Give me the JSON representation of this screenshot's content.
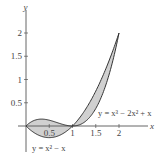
{
  "chart_data": {
    "type": "area",
    "title": "",
    "xlabel": "x",
    "ylabel": "y",
    "xlim": [
      0,
      2.2
    ],
    "ylim": [
      -0.3,
      2.2
    ],
    "x_ticks": [
      0.5,
      1,
      1.5,
      2
    ],
    "x_tick_labels": [
      "0.5",
      "1",
      "1.5",
      "2"
    ],
    "y_ticks": [
      0.5,
      1,
      1.5,
      2
    ],
    "y_tick_labels": [
      "0.5",
      "1",
      "1.5",
      "2"
    ],
    "grid": false,
    "series": [
      {
        "name": "y = x^3 - 2x^2 + x",
        "label": "y = x³ − 2x² + x",
        "x": [
          0,
          0.25,
          0.5,
          0.75,
          1,
          1.25,
          1.5,
          1.75,
          2
        ],
        "values": [
          0,
          0.1406,
          0.125,
          0.0469,
          0,
          0.0781,
          0.375,
          0.9844,
          2
        ]
      },
      {
        "name": "y = x^2 - x",
        "label": "y = x² − x",
        "x": [
          0,
          0.25,
          0.5,
          0.75,
          1,
          1.25,
          1.5,
          1.75,
          2
        ],
        "values": [
          0,
          -0.1875,
          -0.25,
          -0.1875,
          0,
          0.3125,
          0.75,
          1.3125,
          2
        ]
      }
    ],
    "shaded_regions": [
      {
        "between": [
          "y = x^3 - 2x^2 + x",
          "y = x^2 - x"
        ],
        "x_range": [
          0,
          1
        ],
        "color": "#d0d0d0"
      },
      {
        "between": [
          "y = x^3 - 2x^2 + x",
          "y = x^2 - x"
        ],
        "x_range": [
          1,
          2
        ],
        "color": "#d0d0d0"
      }
    ],
    "intersections": [
      [
        0,
        0
      ],
      [
        1,
        0
      ],
      [
        2,
        2
      ]
    ]
  },
  "labels": {
    "x_axis": "x",
    "y_axis": "y",
    "curve_cubic": "y = x³ − 2x² + x",
    "curve_quadratic": "y = x² − x",
    "x_ticks": [
      "0.5",
      "1",
      "1.5",
      "2"
    ],
    "y_ticks": [
      "0.5",
      "1",
      "1.5",
      "2"
    ]
  },
  "colors": {
    "fill": "#d0d0d0",
    "curve": "#333333",
    "axis": "#555555"
  }
}
